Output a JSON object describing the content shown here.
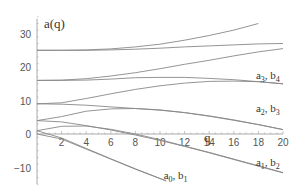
{
  "chart_data": {
    "type": "line",
    "title": "",
    "ylabel": "a(q)",
    "xlabel": "q",
    "xlim": [
      0,
      20
    ],
    "ylim": [
      -15,
      35
    ],
    "x_ticks": [
      "2",
      "4",
      "6",
      "8",
      "10",
      "12",
      "14",
      "16",
      "18",
      "20"
    ],
    "y_ticks": [
      "30",
      "20",
      "10",
      "0",
      "-10"
    ],
    "grid": false,
    "legend": "inline labels",
    "annotations": [
      {
        "text_main": "a",
        "sub1": "0",
        "sep": ", b",
        "sub2": "1",
        "q": 10.3,
        "a": -13.5
      },
      {
        "text_main": "a",
        "sub1": "1",
        "sep": ", b",
        "sub2": "2",
        "q": 17.8,
        "a": -9.5
      },
      {
        "text_main": "a",
        "sub1": "2",
        "sep": ", b",
        "sub2": "3",
        "q": 17.8,
        "a": 6.5
      },
      {
        "text_main": "a",
        "sub1": "3",
        "sep": ", b",
        "sub2": "4",
        "q": 17.8,
        "a": 16.5
      }
    ],
    "series": [
      {
        "name": "a0",
        "x": [
          0,
          2,
          4,
          6,
          8,
          10.5
        ],
        "values": [
          0,
          -1.5,
          -4.5,
          -7.5,
          -10.5,
          -14
        ]
      },
      {
        "name": "b1",
        "x": [
          0,
          2,
          4,
          6,
          8,
          10.5
        ],
        "values": [
          1,
          -1.2,
          -4.3,
          -7.4,
          -10.4,
          -14
        ]
      },
      {
        "name": "a1",
        "x": [
          0,
          2,
          4,
          6,
          8,
          10,
          12,
          14,
          16,
          18,
          20
        ],
        "values": [
          1,
          2.3,
          2.4,
          1.4,
          0,
          -1.7,
          -3.6,
          -5.5,
          -7.5,
          -9.5,
          -11.5
        ]
      },
      {
        "name": "b2",
        "x": [
          0,
          2,
          4,
          6,
          8,
          10,
          12,
          14,
          16,
          18,
          20
        ],
        "values": [
          4,
          3.6,
          2.5,
          1.2,
          -0.3,
          -1.9,
          -3.7,
          -5.6,
          -7.6,
          -9.6,
          -11.6
        ]
      },
      {
        "name": "a2",
        "x": [
          0,
          2,
          4,
          6,
          8,
          10,
          12,
          14,
          16,
          18,
          20
        ],
        "values": [
          4,
          5.2,
          6.8,
          7.5,
          7.6,
          7.2,
          6.4,
          5.3,
          4.1,
          2.8,
          1.3
        ]
      },
      {
        "name": "b3",
        "x": [
          0,
          2,
          4,
          6,
          8,
          10,
          12,
          14,
          16,
          18,
          20
        ],
        "values": [
          9,
          8.9,
          8.6,
          8.1,
          7.6,
          7.1,
          6.4,
          5.4,
          4.2,
          2.8,
          1.3
        ]
      },
      {
        "name": "a3",
        "x": [
          0,
          2,
          4,
          6,
          8,
          10,
          12,
          14,
          16,
          18,
          20
        ],
        "values": [
          9,
          9.3,
          10.6,
          12,
          13.3,
          14.4,
          15.2,
          15.7,
          15.8,
          15.6,
          15
        ]
      },
      {
        "name": "b4",
        "x": [
          0,
          2,
          4,
          6,
          8,
          10,
          12,
          14,
          16,
          18,
          20
        ],
        "values": [
          16,
          16,
          16.1,
          16.4,
          16.8,
          16.9,
          16.9,
          16.6,
          16.2,
          15.6,
          15
        ]
      },
      {
        "name": "a4",
        "x": [
          0,
          2,
          4,
          6,
          8,
          10,
          12,
          14,
          16,
          18,
          20
        ],
        "values": [
          16,
          16.1,
          16.5,
          17.3,
          18.3,
          19.5,
          20.8,
          22,
          23.3,
          24.5,
          25.5
        ]
      },
      {
        "name": "b5",
        "x": [
          0,
          2,
          4,
          6,
          8,
          10,
          12,
          14,
          16,
          18,
          20
        ],
        "values": [
          25,
          25,
          25,
          25.1,
          25.3,
          25.6,
          26,
          26.3,
          26.6,
          26.9,
          27
        ]
      },
      {
        "name": "a5",
        "x": [
          0,
          2,
          4,
          6,
          8,
          10,
          12,
          14,
          16,
          18
        ],
        "values": [
          25,
          25,
          25.1,
          25.4,
          26,
          26.8,
          28,
          29.4,
          31,
          33
        ]
      }
    ]
  }
}
